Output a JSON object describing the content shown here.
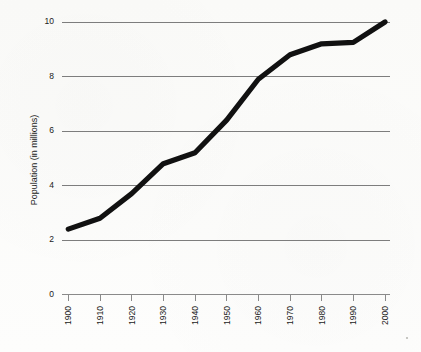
{
  "chart_data": {
    "type": "line",
    "title": "",
    "subtitle": "",
    "xlabel": "",
    "ylabel": "Population (in millions)",
    "categories": [
      "1900",
      "1910",
      "1920",
      "1930",
      "1940",
      "1950",
      "1960",
      "1970",
      "1980",
      "1990",
      "2000"
    ],
    "x": [
      1900,
      1910,
      1920,
      1930,
      1940,
      1950,
      1960,
      1970,
      1980,
      1990,
      2000
    ],
    "values": [
      2.4,
      2.8,
      3.7,
      4.8,
      5.2,
      6.4,
      7.9,
      8.8,
      9.2,
      9.25,
      10.0
    ],
    "series": [
      {
        "name": "Population",
        "values": [
          2.4,
          2.8,
          3.7,
          4.8,
          5.2,
          6.4,
          7.9,
          8.8,
          9.2,
          9.25,
          10.0
        ],
        "color": "#111111"
      }
    ],
    "xlim": [
      1900,
      2000
    ],
    "ylim": [
      0,
      10
    ],
    "ytick_labels": [
      "0",
      "2",
      "4",
      "6",
      "8",
      "10"
    ],
    "ytick_values": [
      0,
      2,
      4,
      6,
      8,
      10
    ],
    "xtick_labels": [
      "1900",
      "1910",
      "1920",
      "1930",
      "1940",
      "1950",
      "1960",
      "1970",
      "1980",
      "1990",
      "2000"
    ],
    "grid": "horizontal",
    "gridline_color": "#7d7d7d",
    "legend": "none",
    "legend_position": "none",
    "annotations": [],
    "background_color": "#fdfdfc",
    "line_color": "#111111",
    "axis_color": "#8a8a8a"
  },
  "axis": {
    "y_title": "Population (in millions)",
    "y_labels": [
      "10",
      "8",
      "6",
      "4",
      "2",
      "0"
    ],
    "x_labels": [
      "1900",
      "1910",
      "1920",
      "1930",
      "1940",
      "1950",
      "1960",
      "1970",
      "1980",
      "1990",
      "2000"
    ]
  }
}
